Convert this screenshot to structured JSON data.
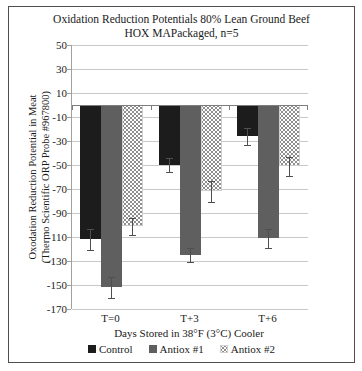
{
  "chart_data": {
    "type": "bar",
    "title_line1": "Oxidation Reduction Potentials 80% Lean Ground Beef",
    "title_line2": "HOX MAPackaged, n=5",
    "ylabel_line1": "Oxodation Reduction Potential in Meat",
    "ylabel_line2": "(Thermo Scientific ORP Probe #967800)",
    "xlabel": "Days Stored in 38°F (3°C) Cooler",
    "categories": [
      "T=0",
      "T+3",
      "T+6"
    ],
    "series": [
      {
        "name": "Control",
        "pattern": "solid",
        "color": "#1c1c1c",
        "values": [
          -112,
          -50,
          -26
        ],
        "errors": [
          9,
          6,
          7
        ]
      },
      {
        "name": "Antiox #1",
        "pattern": "solid",
        "color": "#5f5f5f",
        "values": [
          -152,
          -125,
          -111
        ],
        "errors": [
          9,
          6,
          8
        ]
      },
      {
        "name": "Antiox #2",
        "pattern": "dotted",
        "color": "#8f8f8f",
        "values": [
          -101,
          -72,
          -51
        ],
        "errors": [
          7,
          9,
          8
        ]
      }
    ],
    "ylim": [
      -170,
      50
    ],
    "ytick_step": 20,
    "yticks": [
      50,
      30,
      10,
      -10,
      -30,
      -50,
      -70,
      -90,
      -110,
      -130,
      -150,
      -170
    ],
    "grid": true,
    "error_bars": true,
    "legend_position": "bottom",
    "colors": {
      "gridline": "#c9c9c9",
      "axis": "#a0a0a0",
      "zero_axis": "#7d7d7d",
      "error_bar": "#4f4f4f",
      "frame_border": "#4f4f4f",
      "background": "#ffffff",
      "pattern_dot": "#8f8f8f",
      "text": "#1a1a1a"
    }
  }
}
